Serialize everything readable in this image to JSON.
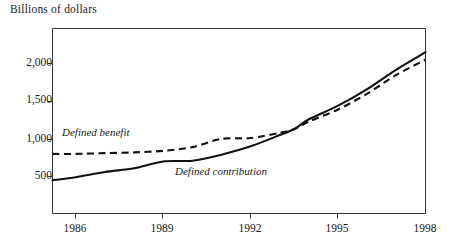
{
  "chart_data": {
    "type": "line",
    "title": "Billions of dollars",
    "xlabel": "",
    "ylabel": "Billions of dollars",
    "xlim": [
      1985.2,
      1998.0
    ],
    "ylim": [
      0,
      2300
    ],
    "grid": false,
    "legend_position": "inline-annotation",
    "x_ticks": [
      "1986",
      "1989",
      "1992",
      "1995",
      "1998"
    ],
    "x_tick_values": [
      1986,
      1989,
      1992,
      1995,
      1998
    ],
    "y_ticks": [
      "500",
      "1,000",
      "1,500",
      "2,000"
    ],
    "y_tick_values": [
      500,
      1000,
      1500,
      2000
    ],
    "x": [
      1985.2,
      1986,
      1987,
      1988,
      1989,
      1990,
      1991,
      1992,
      1993,
      1993.5,
      1994,
      1995,
      1996,
      1997,
      1998
    ],
    "series": [
      {
        "name": "Defined benefit",
        "style": "dashed",
        "values": [
          800,
          800,
          810,
          820,
          840,
          890,
          1000,
          1010,
          1080,
          1130,
          1230,
          1390,
          1600,
          1850,
          2050
        ]
      },
      {
        "name": "Defined contribution",
        "style": "solid",
        "values": [
          450,
          490,
          560,
          610,
          700,
          710,
          790,
          900,
          1050,
          1130,
          1260,
          1440,
          1660,
          1920,
          2150
        ]
      }
    ],
    "annotations": [
      {
        "text": "Defined benefit",
        "x": 1987.0,
        "y": 1130
      },
      {
        "text": "Defined contribution",
        "x": 1990.1,
        "y": 560
      }
    ]
  },
  "axes": {
    "title_text": "Billions of dollars",
    "ytick_labels": [
      "2,000",
      "1,500",
      "1,000",
      "500"
    ],
    "xtick_labels": [
      "1986",
      "1989",
      "1992",
      "1995",
      "1998"
    ]
  },
  "labels": {
    "defined_benefit": "Defined benefit",
    "defined_contribution": "Defined contribution"
  },
  "colors": {
    "line": "#111111",
    "frame": "#333333",
    "text": "#1a1a1a",
    "background": "#ffffff"
  }
}
